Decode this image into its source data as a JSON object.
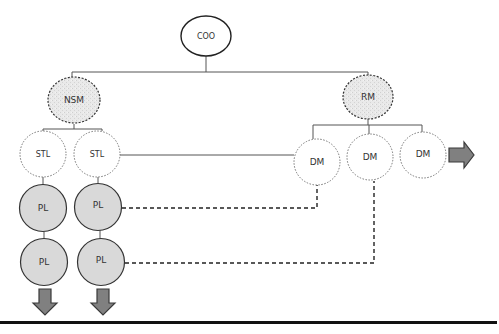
{
  "diagram": {
    "type": "org-chart",
    "colors": {
      "line": "#555555",
      "dashed_link": "#222222",
      "manager_fill": "#e6e6e6",
      "pl_fill": "#d9d9d9",
      "arrow_fill": "#808080",
      "arrow_stroke": "#3a3a3a",
      "baseline": "#111111"
    },
    "nodes": {
      "coo": {
        "label": "COO"
      },
      "nsm": {
        "label": "NSM"
      },
      "rm": {
        "label": "RM"
      },
      "stl_1": {
        "label": "STL"
      },
      "stl_2": {
        "label": "STL"
      },
      "dm_1": {
        "label": "DM"
      },
      "dm_2": {
        "label": "DM"
      },
      "dm_3": {
        "label": "DM"
      },
      "pl_1a": {
        "label": "PL"
      },
      "pl_2a": {
        "label": "PL"
      },
      "pl_1b": {
        "label": "PL"
      },
      "pl_2b": {
        "label": "PL"
      }
    },
    "edges": [
      {
        "from": "COO",
        "to": "NSM",
        "style": "solid"
      },
      {
        "from": "COO",
        "to": "RM",
        "style": "solid"
      },
      {
        "from": "NSM",
        "to": "STL (1)",
        "style": "solid"
      },
      {
        "from": "NSM",
        "to": "STL (2)",
        "style": "solid"
      },
      {
        "from": "RM",
        "to": "DM (1)",
        "style": "solid"
      },
      {
        "from": "RM",
        "to": "DM (2)",
        "style": "solid"
      },
      {
        "from": "RM",
        "to": "DM (3)",
        "style": "solid"
      },
      {
        "from": "STL (2)",
        "to": "DM (1)",
        "style": "solid"
      },
      {
        "from": "STL (1)",
        "to": "PL (1a)",
        "style": "solid"
      },
      {
        "from": "STL (2)",
        "to": "PL (2a)",
        "style": "solid"
      },
      {
        "from": "PL (1a)",
        "to": "PL (1b)",
        "style": "solid"
      },
      {
        "from": "PL (2a)",
        "to": "PL (2b)",
        "style": "solid"
      },
      {
        "from": "PL (2a)",
        "to": "DM (1)",
        "style": "dashed"
      },
      {
        "from": "PL (2b)",
        "to": "DM (2)",
        "style": "dashed"
      }
    ],
    "continuation_arrows": [
      {
        "direction": "right",
        "after": "DM (3)"
      },
      {
        "direction": "down",
        "after": "PL (1b)"
      },
      {
        "direction": "down",
        "after": "PL (2b)"
      }
    ]
  }
}
